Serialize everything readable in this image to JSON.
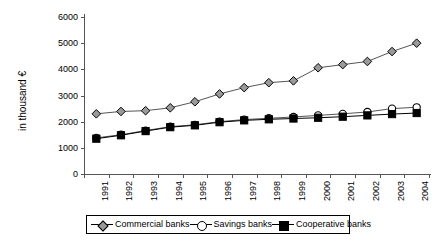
{
  "chart_data": {
    "type": "line",
    "title": "",
    "xlabel": "",
    "ylabel": "in thousand €",
    "ylim": [
      0,
      6000
    ],
    "ytick_values": [
      0,
      1000,
      2000,
      3000,
      4000,
      5000,
      6000
    ],
    "ytick_labels": [
      "0",
      "1000",
      "2000",
      "3000",
      "4000",
      "5000",
      "6000"
    ],
    "grid": false,
    "legend_position": "bottom",
    "categories": [
      "1991",
      "1992",
      "1993",
      "1994",
      "1995",
      "1996",
      "1997",
      "1998",
      "1999",
      "2000",
      "2001",
      "2002",
      "2003",
      "2004"
    ],
    "series": [
      {
        "name": "Commercial banks",
        "marker": "diamond",
        "color": "#9a9a9a",
        "line_color": "#555555",
        "values": [
          2300,
          2390,
          2420,
          2530,
          2760,
          3060,
          3300,
          3490,
          3560,
          4060,
          4180,
          4300,
          4680,
          5000
        ]
      },
      {
        "name": "Savings banks",
        "marker": "circle",
        "color": "#ffffff",
        "line_color": "#555555",
        "values": [
          1380,
          1500,
          1660,
          1810,
          1880,
          2000,
          2080,
          2130,
          2180,
          2240,
          2300,
          2370,
          2500,
          2550
        ]
      },
      {
        "name": "Cooperative banks",
        "marker": "square",
        "color": "#000000",
        "line_color": "#000000",
        "values": [
          1350,
          1480,
          1640,
          1790,
          1860,
          1980,
          2050,
          2090,
          2120,
          2150,
          2190,
          2240,
          2290,
          2330
        ]
      }
    ]
  },
  "legend": {
    "items": [
      {
        "label": "Commercial banks",
        "marker": "diamond-icon"
      },
      {
        "label": "Savings banks",
        "marker": "circle-icon"
      },
      {
        "label": "Cooperative banks",
        "marker": "square-icon"
      }
    ]
  }
}
